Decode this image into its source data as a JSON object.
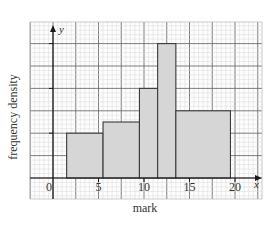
{
  "chart_data": {
    "type": "bar",
    "subtype": "histogram",
    "title": "",
    "xlabel": "mark",
    "ylabel": "frequency density",
    "x_axis_symbol": "x",
    "y_axis_symbol": "y",
    "x_ticks": [
      0,
      5,
      10,
      15,
      20
    ],
    "x_tick_labels": [
      "0",
      "5",
      "10",
      "15",
      "20"
    ],
    "xlim": [
      -2.5,
      22.7
    ],
    "ylim": [
      -1,
      7
    ],
    "grid": true,
    "legend": null,
    "bins": [
      {
        "start": 1.5,
        "end": 5.5,
        "height": 2
      },
      {
        "start": 5.5,
        "end": 9.5,
        "height": 2.5
      },
      {
        "start": 9.5,
        "end": 11.5,
        "height": 4
      },
      {
        "start": 11.5,
        "end": 13.5,
        "height": 6
      },
      {
        "start": 13.5,
        "end": 19.5,
        "height": 3
      }
    ],
    "categories": [
      "1.5-5.5",
      "5.5-9.5",
      "9.5-11.5",
      "11.5-13.5",
      "13.5-19.5"
    ],
    "values": [
      2,
      2.5,
      4,
      6,
      3
    ]
  },
  "colors": {
    "bar_fill": "#d6d6d6",
    "bar_stroke": "#3a3a3a",
    "grid_minor": "#d8d8d8",
    "grid_major": "#6e6e6e",
    "axis": "#1a1a1a",
    "text": "#333333"
  }
}
